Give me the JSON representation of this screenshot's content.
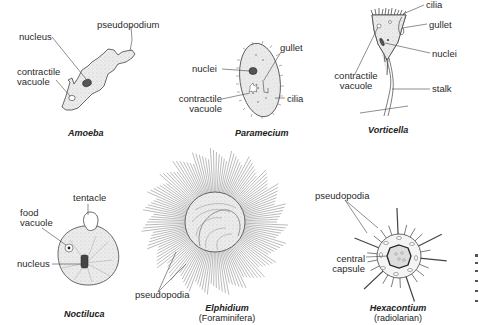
{
  "figure": {
    "organisms": [
      {
        "name": "Amoeba",
        "labels": [
          "pseudopodium",
          "nucleus",
          "contractile",
          "vacuole"
        ]
      },
      {
        "name": "Paramecium",
        "labels": [
          "gullet",
          "nuclei",
          "contractile",
          "vacuole",
          "cilia"
        ]
      },
      {
        "name": "Vorticella",
        "labels": [
          "cilia",
          "gullet",
          "nuclei",
          "contractile",
          "vacuole",
          "stalk"
        ]
      },
      {
        "name": "Noctiluca",
        "labels": [
          "tentacle",
          "food",
          "vacuole",
          "nucleus"
        ]
      },
      {
        "name": "Elphidium",
        "subtitle": "(Foraminifera)",
        "labels": [
          "pseudopodia"
        ]
      },
      {
        "name": "Hexacontium",
        "subtitle": "(radiolarian)",
        "labels": [
          "pseudopodia",
          "central",
          "capsule"
        ]
      }
    ]
  },
  "colors": {
    "line": "#3a3a3a",
    "fill": "#e6e6e6",
    "text": "#2a2a2a"
  }
}
